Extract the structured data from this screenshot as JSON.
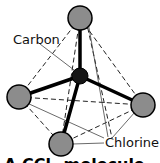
{
  "diagram": {
    "labels": {
      "carbon": "Carbon",
      "chlorine": "Chlorine"
    },
    "caption": "A CCl₄ molecule",
    "colors": {
      "chlorine_fill": "#8c8c8c",
      "carbon_fill": "#151515",
      "bond": "#000000",
      "edge": "#222222"
    },
    "atoms": [
      {
        "id": "cl-top",
        "element": "Cl",
        "cx": 80,
        "cy": 18,
        "r": 12
      },
      {
        "id": "cl-left",
        "element": "Cl",
        "cx": 19,
        "cy": 97,
        "r": 12
      },
      {
        "id": "cl-right",
        "element": "Cl",
        "cx": 143,
        "cy": 105,
        "r": 12
      },
      {
        "id": "cl-bottom",
        "element": "Cl",
        "cx": 61,
        "cy": 144,
        "r": 12
      },
      {
        "id": "c-center",
        "element": "C",
        "cx": 80,
        "cy": 76,
        "r": 8
      }
    ]
  }
}
